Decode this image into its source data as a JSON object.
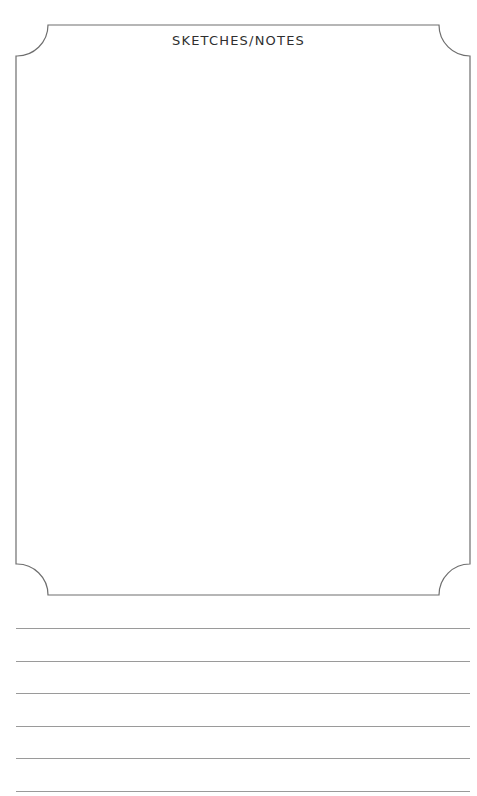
{
  "page": {
    "title": "SKETCHES/NOTES",
    "frame": {
      "left": 16,
      "top": 25,
      "right": 470,
      "bottom": 595,
      "corner_radius": 31,
      "stroke": "#6e6e6e"
    },
    "ruled_lines": {
      "count": 6,
      "y_positions": [
        628,
        661,
        693,
        726,
        758,
        791
      ],
      "color": "#9a9a9a"
    }
  }
}
